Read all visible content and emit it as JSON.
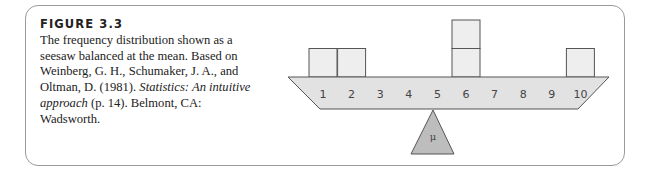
{
  "figure": {
    "title": "FIGURE 3.3",
    "caption_plain_1": "The frequency distribution shown as a seesaw balanced at the mean. Based on Weinberg, G. H., Schumaker, J. A., and Oltman, D. (1981). ",
    "caption_italic": "Statistics: An intuitive approach",
    "caption_plain_2": " (p. 14). Belmont, CA: Wadsworth."
  },
  "chart_data": {
    "type": "bar",
    "categories": [
      "1",
      "2",
      "3",
      "4",
      "5",
      "6",
      "7",
      "8",
      "9",
      "10"
    ],
    "values": [
      1,
      1,
      0,
      0,
      0,
      2,
      0,
      0,
      0,
      1
    ],
    "fulcrum_label": "μ",
    "fulcrum_position": 5,
    "xlabel": "",
    "ylabel": "",
    "grid": false,
    "colors": {
      "box_fill": "#eeeeee",
      "beam_fill": "#e2e2e2",
      "fulcrum_fill": "#bdbdbd",
      "stroke": "#555555"
    }
  }
}
